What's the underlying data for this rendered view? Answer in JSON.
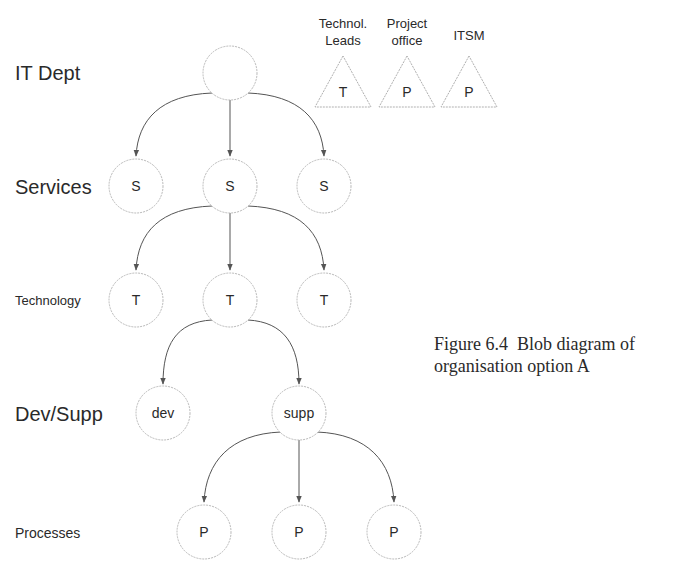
{
  "row_labels": {
    "it_dept": "IT Dept",
    "services": "Services",
    "technology": "Technology",
    "dev_supp": "Dev/Supp",
    "processes": "Processes"
  },
  "nodes": {
    "root": "",
    "services": [
      "S",
      "S",
      "S"
    ],
    "technology": [
      "T",
      "T",
      "T"
    ],
    "dev_supp": [
      "dev",
      "supp"
    ],
    "processes": [
      "P",
      "P",
      "P"
    ]
  },
  "side_groups": [
    {
      "title_line1": "Technol.",
      "title_line2": "Leads",
      "letter": "T"
    },
    {
      "title_line1": "Project",
      "title_line2": "office",
      "letter": "P"
    },
    {
      "title_line1": "ITSM",
      "title_line2": "",
      "letter": "P"
    }
  ],
  "caption": {
    "line1": "Figure 6.4  Blob diagram of",
    "line2": "organisation option A"
  },
  "colors": {
    "text": "#2a2a2a",
    "node_stroke": "#b8b8b8",
    "edge": "#555555"
  }
}
